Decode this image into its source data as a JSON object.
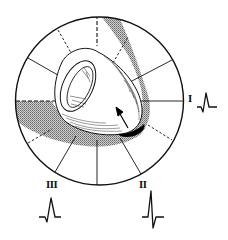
{
  "diagram": {
    "type": "hexaxial-heart-diagram",
    "colors": {
      "ink": "#111111",
      "shading": "#9a9a9a",
      "background": "#ffffff",
      "infarct": "#000000"
    },
    "circle": {
      "cx": 99.5,
      "cy": 101,
      "r": 84
    },
    "leads": [
      {
        "id": "I",
        "label": "I",
        "position": "right",
        "waveform": "qR"
      },
      {
        "id": "II",
        "label": "II",
        "position": "lower-right",
        "waveform": "tall R with deep S"
      },
      {
        "id": "III",
        "label": "III",
        "position": "lower-left",
        "waveform": "qR"
      }
    ],
    "arrow": {
      "name": "electrical-axis-arrow",
      "direction": "up-left"
    }
  }
}
